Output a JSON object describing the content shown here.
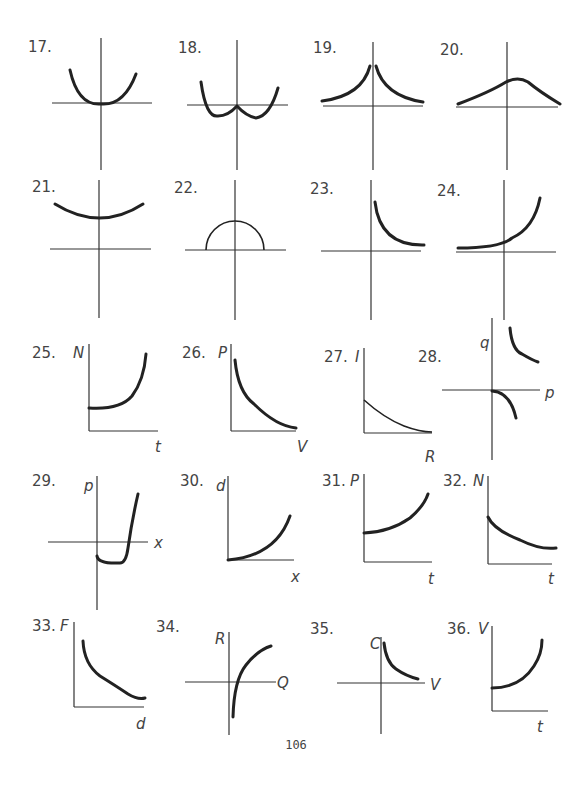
{
  "page": {
    "number": "106"
  },
  "problems": [
    {
      "id": "17",
      "label": "17.",
      "lx": 28,
      "ly": 52,
      "axes": {
        "h": [
          52,
          152,
          103
        ],
        "v": [
          101,
          38,
          170
        ]
      },
      "curves": [
        {
          "d": "M70 70 Q78 106 101 104 Q124 106 136 74",
          "cls": "curve"
        }
      ],
      "vars": []
    },
    {
      "id": "18",
      "label": "18.",
      "lx": 178,
      "ly": 53,
      "axes": {
        "h": [
          187,
          288,
          105
        ],
        "v": [
          237,
          40,
          170
        ]
      },
      "curves": [
        {
          "d": "M201 82 Q206 118 218 116 Q228 116 237 106 Q246 116 256 118 Q270 116 278 88",
          "cls": "curve"
        }
      ],
      "vars": []
    },
    {
      "id": "19",
      "label": "19.",
      "lx": 313,
      "ly": 53,
      "axes": {
        "h": [
          323,
          423,
          106
        ],
        "v": [
          373,
          42,
          170
        ]
      },
      "curves": [
        {
          "d": "M322 101 Q362 96 370 66",
          "cls": "curve"
        },
        {
          "d": "M376 66 Q384 96 423 102",
          "cls": "curve"
        }
      ],
      "vars": []
    },
    {
      "id": "20",
      "label": "20.",
      "lx": 440,
      "ly": 55,
      "axes": {
        "h": [
          456,
          558,
          107
        ],
        "v": [
          507,
          42,
          170
        ]
      },
      "curves": [
        {
          "d": "M458 104 Q490 92 506 82 Q518 76 528 82 Q540 92 560 104",
          "cls": "curve"
        }
      ],
      "vars": []
    },
    {
      "id": "21",
      "label": "21.",
      "lx": 32,
      "ly": 192,
      "axes": {
        "h": [
          50,
          151,
          249
        ],
        "v": [
          99,
          180,
          318
        ]
      },
      "curves": [
        {
          "d": "M55 204 Q100 232 143 204",
          "cls": "curve"
        }
      ],
      "vars": []
    },
    {
      "id": "22",
      "label": "22.",
      "lx": 174,
      "ly": 193,
      "axes": {
        "h": [
          185,
          286,
          250
        ],
        "v": [
          235,
          180,
          320
        ]
      },
      "curves": [
        {
          "d": "M206 250 A29 29 0 0 1 264 250",
          "cls": "thin"
        }
      ],
      "vars": []
    },
    {
      "id": "23",
      "label": "23.",
      "lx": 310,
      "ly": 194,
      "axes": {
        "h": [
          321,
          421,
          251
        ],
        "v": [
          371,
          180,
          320
        ]
      },
      "curves": [
        {
          "d": "M375 202 Q380 246 424 245",
          "cls": "curve"
        }
      ],
      "vars": []
    },
    {
      "id": "24",
      "label": "24.",
      "lx": 437,
      "ly": 196,
      "axes": {
        "h": [
          456,
          556,
          252
        ],
        "v": [
          504,
          180,
          320
        ]
      },
      "curves": [
        {
          "d": "M458 248 Q500 248 512 238 Q534 228 540 198",
          "cls": "curve"
        }
      ],
      "vars": []
    },
    {
      "id": "25",
      "label": "25.",
      "lx": 32,
      "ly": 358,
      "axes": {
        "h": [
          89,
          158,
          431
        ],
        "v": [
          89,
          344,
          431
        ]
      },
      "curves": [
        {
          "d": "M89 408 Q120 410 132 396 Q144 380 146 354",
          "cls": "curve"
        }
      ],
      "vars": [
        {
          "t": "N",
          "x": 73,
          "y": 358
        },
        {
          "t": "t",
          "x": 155,
          "y": 452
        }
      ]
    },
    {
      "id": "26",
      "label": "26.",
      "lx": 182,
      "ly": 358,
      "axes": {
        "h": [
          231,
          296,
          431
        ],
        "v": [
          231,
          344,
          431
        ]
      },
      "curves": [
        {
          "d": "M235 360 Q238 392 254 404 Q276 426 296 428",
          "cls": "curve"
        }
      ],
      "vars": [
        {
          "t": "P",
          "x": 218,
          "y": 358
        },
        {
          "t": "V",
          "x": 297,
          "y": 452
        }
      ]
    },
    {
      "id": "27",
      "label": "27.",
      "lx": 324,
      "ly": 362,
      "axes": {
        "h": [
          364,
          432,
          433
        ],
        "v": [
          364,
          348,
          433
        ]
      },
      "curves": [
        {
          "d": "M364 400 Q384 418 404 426 Q420 432 432 432",
          "cls": "thin"
        }
      ],
      "vars": [
        {
          "t": "I",
          "x": 355,
          "y": 362
        },
        {
          "t": "R",
          "x": 425,
          "y": 462
        }
      ]
    },
    {
      "id": "28",
      "label": "28.",
      "lx": 418,
      "ly": 362,
      "axes": {
        "h": [
          442,
          540,
          390
        ],
        "v": [
          492,
          318,
          460
        ]
      },
      "curves": [
        {
          "d": "M510 328 Q512 350 522 354 Q532 360 538 362",
          "cls": "curve"
        },
        {
          "d": "M492 391 Q510 392 516 418",
          "cls": "curve"
        }
      ],
      "vars": [
        {
          "t": "q",
          "x": 480,
          "y": 348
        },
        {
          "t": "p",
          "x": 545,
          "y": 398
        }
      ]
    },
    {
      "id": "29",
      "label": "29.",
      "lx": 32,
      "ly": 486,
      "axes": {
        "h": [
          48,
          148,
          542
        ],
        "v": [
          97,
          476,
          610
        ]
      },
      "curves": [
        {
          "d": "M97 556 Q98 564 120 563 Q126 563 128 548 Q132 520 138 494",
          "cls": "curve"
        }
      ],
      "vars": [
        {
          "t": "p",
          "x": 84,
          "y": 491
        },
        {
          "t": "x",
          "x": 154,
          "y": 548
        }
      ]
    },
    {
      "id": "30",
      "label": "30.",
      "lx": 180,
      "ly": 486,
      "axes": {
        "h": [
          228,
          294,
          560
        ],
        "v": [
          228,
          476,
          560
        ]
      },
      "curves": [
        {
          "d": "M228 560 Q276 556 290 516",
          "cls": "curve"
        }
      ],
      "vars": [
        {
          "t": "d",
          "x": 216,
          "y": 491
        },
        {
          "t": "x",
          "x": 291,
          "y": 582
        }
      ]
    },
    {
      "id": "31",
      "label": "31.",
      "lx": 322,
      "ly": 486,
      "axes": {
        "h": [
          364,
          432,
          562
        ],
        "v": [
          364,
          474,
          562
        ]
      },
      "curves": [
        {
          "d": "M364 533 Q390 532 410 518 Q424 506 428 494",
          "cls": "curve"
        }
      ],
      "vars": [
        {
          "t": "P",
          "x": 350,
          "y": 486
        },
        {
          "t": "t",
          "x": 428,
          "y": 584
        }
      ]
    },
    {
      "id": "32",
      "label": "32.",
      "lx": 443,
      "ly": 486,
      "axes": {
        "h": [
          488,
          552,
          564
        ],
        "v": [
          488,
          476,
          564
        ]
      },
      "curves": [
        {
          "d": "M488 517 Q494 530 520 540 Q540 550 556 548",
          "cls": "curve"
        }
      ],
      "vars": [
        {
          "t": "N",
          "x": 473,
          "y": 486
        },
        {
          "t": "t",
          "x": 548,
          "y": 584
        }
      ]
    },
    {
      "id": "33",
      "label": "33.",
      "lx": 32,
      "ly": 631,
      "axes": {
        "h": [
          74,
          144,
          707
        ],
        "v": [
          74,
          622,
          707
        ]
      },
      "curves": [
        {
          "d": "M83 641 Q84 664 100 676 Q116 686 128 694 Q138 700 145 698",
          "cls": "curve"
        }
      ],
      "vars": [
        {
          "t": "F",
          "x": 60,
          "y": 631
        },
        {
          "t": "d",
          "x": 136,
          "y": 729
        }
      ]
    },
    {
      "id": "34",
      "label": "34.",
      "lx": 156,
      "ly": 632,
      "axes": {
        "h": [
          185,
          276,
          682
        ],
        "v": [
          229,
          632,
          735
        ]
      },
      "curves": [
        {
          "d": "M233 717 Q234 680 246 665 Q258 650 271 646",
          "cls": "curve"
        }
      ],
      "vars": [
        {
          "t": "R",
          "x": 215,
          "y": 644
        },
        {
          "t": "Q",
          "x": 277,
          "y": 688
        }
      ]
    },
    {
      "id": "35",
      "label": "35.",
      "lx": 310,
      "ly": 634,
      "axes": {
        "h": [
          337,
          425,
          683
        ],
        "v": [
          381,
          637,
          734
        ]
      },
      "curves": [
        {
          "d": "M384 643 Q386 662 396 669 Q406 676 418 679",
          "cls": "curve"
        }
      ],
      "vars": [
        {
          "t": "C",
          "x": 370,
          "y": 649
        },
        {
          "t": "V",
          "x": 430,
          "y": 690
        }
      ]
    },
    {
      "id": "36",
      "label": "36.",
      "lx": 447,
      "ly": 634,
      "axes": {
        "h": [
          492,
          548,
          711
        ],
        "v": [
          492,
          626,
          711
        ]
      },
      "curves": [
        {
          "d": "M492 688 Q520 688 534 666 Q542 654 542 640",
          "cls": "curve"
        }
      ],
      "vars": [
        {
          "t": "V",
          "x": 478,
          "y": 634
        },
        {
          "t": "t",
          "x": 537,
          "y": 732
        }
      ]
    }
  ]
}
